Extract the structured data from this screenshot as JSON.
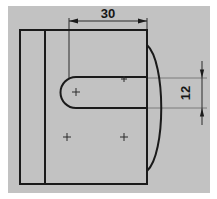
{
  "drawing": {
    "title": "Orthographic view of plate with slot and arc",
    "background_color": "#c2c2c2",
    "paper_color": "#ffffff",
    "line_color": "#1a1a1a",
    "thin_line_color": "#555555",
    "dimensions": [
      {
        "id": "width-dim",
        "label": "30",
        "orientation": "horizontal",
        "value": 30,
        "units": "mm",
        "position": "top"
      },
      {
        "id": "height-dim",
        "label": "12",
        "orientation": "vertical",
        "value": 12,
        "units": "mm",
        "position": "right",
        "text_rotation": -90
      }
    ],
    "features": {
      "outer_plate": {
        "name": "plate-outline",
        "shape": "rectangle",
        "x": 20,
        "y": 30,
        "width": 127,
        "height": 154
      },
      "left_rib_line": {
        "name": "rib-edge-line",
        "shape": "vertical-line",
        "x": 45,
        "y1": 30,
        "y2": 184
      },
      "slot": {
        "name": "rounded-slot",
        "shape": "obround-open-right",
        "left_center_x": 76,
        "center_y": 92,
        "radius": 15,
        "right_x": 147,
        "top_y": 77,
        "bottom_y": 108
      },
      "right_arc": {
        "name": "profile-arc",
        "shape": "arc",
        "start_x": 147,
        "start_y": 45,
        "end_x": 147,
        "end_y": 171,
        "bulge_x": 172
      },
      "center_marks": [
        {
          "name": "slot-center-mark",
          "x": 76,
          "y": 92
        },
        {
          "name": "slot-axis-mark",
          "x": 124,
          "y": 79
        },
        {
          "name": "hole-center-mark-left",
          "x": 67,
          "y": 137
        },
        {
          "name": "hole-center-mark-right",
          "x": 124,
          "y": 137
        }
      ]
    }
  }
}
